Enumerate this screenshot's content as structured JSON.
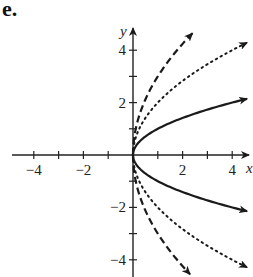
{
  "panel_label": "e.",
  "chart_data": {
    "type": "line",
    "title": "",
    "panel_label": "e.",
    "xlabel": "x",
    "ylabel": "y",
    "xlim": [
      -5,
      4.8
    ],
    "ylim": [
      -4.6,
      5.0
    ],
    "x_ticks": [
      -4,
      -3,
      -2,
      -1,
      1,
      2,
      3,
      4
    ],
    "x_tick_labels": [
      "-4",
      "-2",
      "2",
      "4"
    ],
    "y_ticks": [
      -4,
      -3,
      -2,
      -1,
      1,
      2,
      3,
      4
    ],
    "y_tick_labels": [
      "4",
      "2",
      "-2",
      "-4"
    ],
    "grid": false,
    "legend": null,
    "series": [
      {
        "name": "solid",
        "style": "solid",
        "equation": "x = y^2 (y = ±sqrt(x))",
        "k": 1,
        "points_upper": [
          [
            0,
            0
          ],
          [
            1,
            1
          ],
          [
            2,
            1.41
          ],
          [
            3,
            1.73
          ],
          [
            4,
            2
          ],
          [
            4.6,
            2.14
          ]
        ],
        "points_lower": [
          [
            0,
            0
          ],
          [
            1,
            -1
          ],
          [
            2,
            -1.41
          ],
          [
            3,
            -1.73
          ],
          [
            4,
            -2
          ],
          [
            4.6,
            -2.14
          ]
        ]
      },
      {
        "name": "dotted",
        "style": "dotted",
        "equation": "y = ±2sqrt(x)",
        "k": 2,
        "points_upper": [
          [
            0,
            0
          ],
          [
            1,
            2
          ],
          [
            2,
            2.83
          ],
          [
            3,
            3.46
          ],
          [
            4,
            4
          ],
          [
            4.6,
            4.29
          ]
        ],
        "points_lower": [
          [
            0,
            0
          ],
          [
            1,
            -2
          ],
          [
            2,
            -2.83
          ],
          [
            3,
            -3.46
          ],
          [
            4,
            -4
          ],
          [
            4.6,
            -4.29
          ]
        ]
      },
      {
        "name": "dashed",
        "style": "dashed",
        "equation": "y = ±3sqrt(x)",
        "k": 3,
        "points_upper": [
          [
            0,
            0
          ],
          [
            0.5,
            2.12
          ],
          [
            1,
            3
          ],
          [
            1.5,
            3.67
          ],
          [
            2,
            4.24
          ],
          [
            2.4,
            4.65
          ]
        ],
        "points_lower": [
          [
            0,
            0
          ],
          [
            0.5,
            -2.12
          ],
          [
            1,
            -3
          ],
          [
            1.5,
            -3.67
          ],
          [
            2,
            -4.24
          ],
          [
            2.3,
            -4.55
          ]
        ]
      }
    ]
  }
}
